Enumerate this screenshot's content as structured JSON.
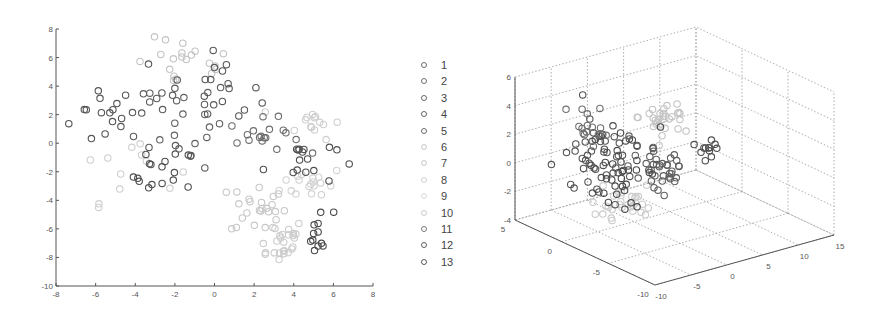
{
  "chart_data": [
    {
      "type": "scatter",
      "title": "",
      "xlabel": "",
      "ylabel": "",
      "xlim": [
        -8,
        8
      ],
      "ylim": [
        -10,
        8
      ],
      "xticks": [
        -8,
        -6,
        -4,
        -2,
        0,
        2,
        4,
        6,
        8
      ],
      "yticks": [
        -10,
        -8,
        -6,
        -4,
        -2,
        0,
        2,
        4,
        6,
        8
      ],
      "grid": false,
      "marker": "circle-open",
      "series": [
        {
          "name": "1",
          "color": "#555555",
          "clusters": [
            {
              "cx": -5.5,
              "cy": 2.0,
              "sx": 0.9,
              "sy": 1.2,
              "n": 14
            }
          ]
        },
        {
          "name": "2",
          "color": "#5a5a5a",
          "clusters": [
            {
              "cx": -3.0,
              "cy": 2.5,
              "sx": 0.9,
              "sy": 1.5,
              "n": 16
            }
          ]
        },
        {
          "name": "3",
          "color": "#4f4f4f",
          "clusters": [
            {
              "cx": -2.5,
              "cy": -2.3,
              "sx": 0.8,
              "sy": 1.0,
              "n": 16
            }
          ]
        },
        {
          "name": "4",
          "color": "#606060",
          "clusters": [
            {
              "cx": -1.2,
              "cy": 1.5,
              "sx": 1.0,
              "sy": 1.6,
              "n": 18
            }
          ]
        },
        {
          "name": "5",
          "color": "#585858",
          "clusters": [
            {
              "cx": 0.5,
              "cy": 3.5,
              "sx": 0.9,
              "sy": 1.2,
              "n": 16
            }
          ]
        },
        {
          "name": "6",
          "color": "#c4c4c4",
          "clusters": [
            {
              "cx": -1.5,
              "cy": 5.5,
              "sx": 1.3,
              "sy": 0.9,
              "n": 20
            }
          ]
        },
        {
          "name": "7",
          "color": "#c8c8c8",
          "clusters": [
            {
              "cx": 2.2,
              "cy": -4.5,
              "sx": 0.7,
              "sy": 1.0,
              "n": 24
            }
          ]
        },
        {
          "name": "8",
          "color": "#cccccc",
          "clusters": [
            {
              "cx": 3.2,
              "cy": -6.8,
              "sx": 0.7,
              "sy": 0.8,
              "n": 26
            }
          ]
        },
        {
          "name": "9",
          "color": "#d2d2d2",
          "clusters": [
            {
              "cx": 5.0,
              "cy": -2.8,
              "sx": 0.8,
              "sy": 0.6,
              "n": 18
            }
          ]
        },
        {
          "name": "10",
          "color": "#cfcfcf",
          "clusters": [
            {
              "cx": 5.0,
              "cy": 1.5,
              "sx": 0.7,
              "sy": 0.6,
              "n": 14
            },
            {
              "cx": -4.5,
              "cy": -1.5,
              "sx": 1.3,
              "sy": 1.3,
              "n": 12
            }
          ]
        },
        {
          "name": "11",
          "color": "#6e6e6e",
          "clusters": [
            {
              "cx": 2.5,
              "cy": 0.5,
              "sx": 0.9,
              "sy": 0.6,
              "n": 18
            }
          ]
        },
        {
          "name": "12",
          "color": "#505050",
          "clusters": [
            {
              "cx": 4.3,
              "cy": -1.2,
              "sx": 0.9,
              "sy": 0.9,
              "n": 16
            }
          ]
        },
        {
          "name": "13",
          "color": "#4a4a4a",
          "clusters": [
            {
              "cx": 5.3,
              "cy": -6.4,
              "sx": 0.35,
              "sy": 0.9,
              "n": 12
            }
          ]
        }
      ]
    },
    {
      "type": "scatter3d",
      "title": "",
      "xlim": [
        -10,
        15
      ],
      "ylim": [
        -10,
        5
      ],
      "zlim": [
        -4,
        6
      ],
      "xticks": [
        -10,
        -5,
        0,
        5,
        10,
        15
      ],
      "yticks": [
        -10,
        -5,
        0,
        5
      ],
      "zticks": [
        -4,
        -2,
        0,
        2,
        4,
        6
      ],
      "grid": true,
      "marker": "circle-open",
      "series_note": "Same 13 classes as legend; dense cluster near x -5..5, y -5..5, z -3..3",
      "clusters": [
        {
          "cls": "1",
          "color": "#555555",
          "cx": 380,
          "cy": 165,
          "sx": 6,
          "sy": 5,
          "sz": 1.4,
          "n": 40,
          "px": [
            600,
            160
          ],
          "spread": [
            28,
            32
          ]
        },
        {
          "cls": "3",
          "color": "#4a4a4a",
          "px": [
            620,
            170
          ],
          "spread": [
            30,
            28
          ],
          "n": 40
        },
        {
          "cls": "4",
          "color": "#606060",
          "px": [
            660,
            165
          ],
          "spread": [
            26,
            26
          ],
          "n": 36
        },
        {
          "cls": "6",
          "color": "#c4c4c4",
          "px": [
            665,
            118
          ],
          "spread": [
            22,
            14
          ],
          "n": 30
        },
        {
          "cls": "8",
          "color": "#cccccc",
          "px": [
            620,
            200
          ],
          "spread": [
            30,
            16
          ],
          "n": 30
        },
        {
          "cls": "12",
          "color": "#505050",
          "px": [
            710,
            150
          ],
          "spread": [
            10,
            10
          ],
          "n": 12
        },
        {
          "cls": "11",
          "color": "#707070",
          "px": [
            590,
            120
          ],
          "spread": [
            18,
            18
          ],
          "n": 16
        }
      ]
    }
  ],
  "legend": {
    "entries": [
      "1",
      "2",
      "3",
      "4",
      "5",
      "6",
      "7",
      "8",
      "9",
      "10",
      "11",
      "12",
      "13"
    ],
    "colors": [
      "#6a6a6a",
      "#707070",
      "#6a6a6a",
      "#666666",
      "#6a6a6a",
      "#c8c8c8",
      "#c8c8c8",
      "#d0d0d0",
      "#d8d8d8",
      "#cccccc",
      "#7a7a7a",
      "#606060",
      "#5a5a5a"
    ]
  }
}
